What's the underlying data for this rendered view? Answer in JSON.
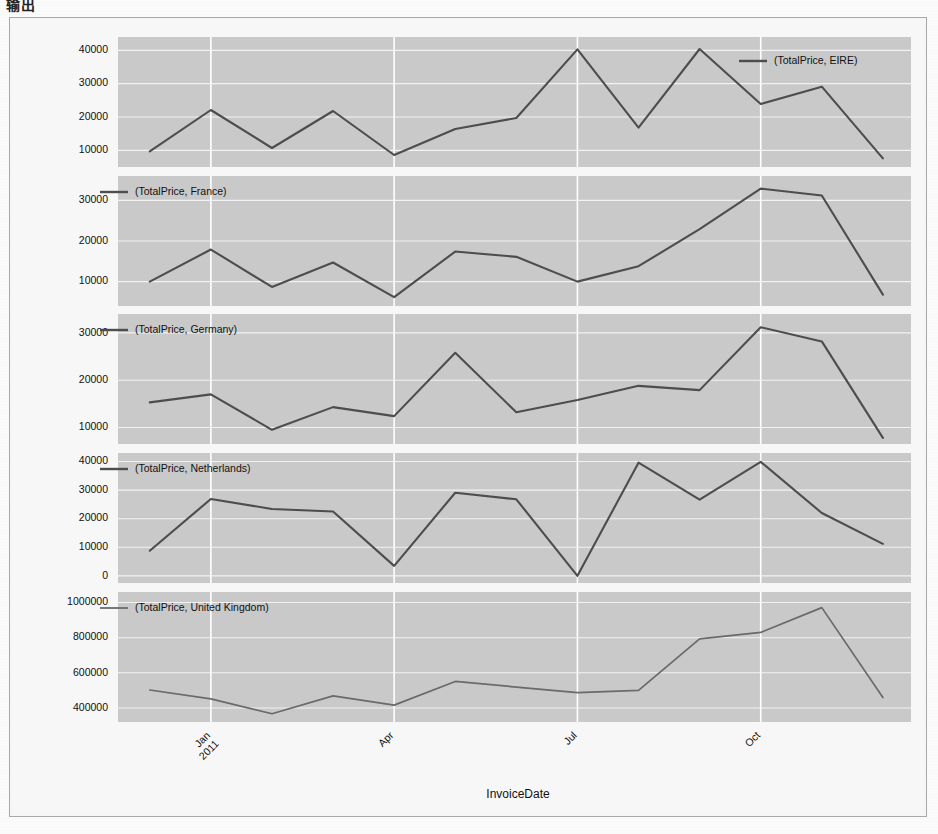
{
  "document": {
    "title_text": "输出",
    "xaxis_title": "InvoiceDate"
  },
  "figure": {
    "background_color": "#f7f7f7",
    "panel_color": "#c9c9c9",
    "line_color": "#4d4d4d",
    "grid_color": "#f2f2f2",
    "vgrid_color": "#ffffff",
    "border_color": "#a8a8a8"
  },
  "chart_data": {
    "type": "line",
    "title": "输出",
    "xlabel": "InvoiceDate",
    "ylabel": "",
    "grid": true,
    "legend_position": "inside-top",
    "layout": "5 stacked subplots sharing the InvoiceDate x-axis",
    "x": [
      "2010-12",
      "2011-01",
      "2011-02",
      "2011-03",
      "2011-04",
      "2011-05",
      "2011-06",
      "2011-07",
      "2011-08",
      "2011-09",
      "2011-10",
      "2011-11",
      "2011-12"
    ],
    "x_tick_labels": [
      "Jan\n2011",
      "Apr",
      "Jul",
      "Oct"
    ],
    "x_tick_positions": [
      "2011-01",
      "2011-04",
      "2011-07",
      "2011-10"
    ],
    "panels": [
      {
        "name": "EIRE",
        "legend": "(TotalPrice, EIRE)",
        "legend_align": "right",
        "ylim": [
          5000,
          44000
        ],
        "yticks": [
          10000,
          20000,
          30000,
          40000
        ],
        "values": [
          9700,
          22100,
          10700,
          21800,
          8600,
          16400,
          19700,
          40300,
          16800,
          40400,
          23900,
          29100,
          7600
        ]
      },
      {
        "name": "France",
        "legend": "(TotalPrice, France)",
        "legend_align": "left",
        "ylim": [
          4000,
          36000
        ],
        "yticks": [
          10000,
          20000,
          30000
        ],
        "values": [
          10000,
          17900,
          8700,
          14700,
          6200,
          17400,
          16100,
          10000,
          13800,
          22900,
          32900,
          31200,
          6800
        ]
      },
      {
        "name": "Germany",
        "legend": "(TotalPrice, Germany)",
        "legend_align": "left",
        "ylim": [
          6500,
          34000
        ],
        "yticks": [
          10000,
          20000,
          30000
        ],
        "values": [
          15300,
          17000,
          9500,
          14300,
          12400,
          25800,
          13200,
          15800,
          18800,
          17900,
          31200,
          28200,
          7800
        ]
      },
      {
        "name": "Netherlands",
        "legend": "(TotalPrice, Netherlands)",
        "legend_align": "left",
        "ylim": [
          -2500,
          43000
        ],
        "yticks": [
          0,
          10000,
          20000,
          30000,
          40000
        ],
        "values": [
          8800,
          26900,
          23400,
          22500,
          3500,
          29100,
          26800,
          0,
          39600,
          26700,
          39900,
          22000,
          11200
        ]
      },
      {
        "name": "United Kingdom",
        "legend": "(TotalPrice, United Kingdom)",
        "legend_align": "left",
        "ylim": [
          320000,
          1060000
        ],
        "yticks": [
          400000,
          600000,
          800000,
          1000000
        ],
        "values": [
          502000,
          452000,
          367000,
          469000,
          416000,
          551000,
          519000,
          487000,
          500000,
          793000,
          830000,
          971000,
          459000
        ]
      }
    ]
  }
}
